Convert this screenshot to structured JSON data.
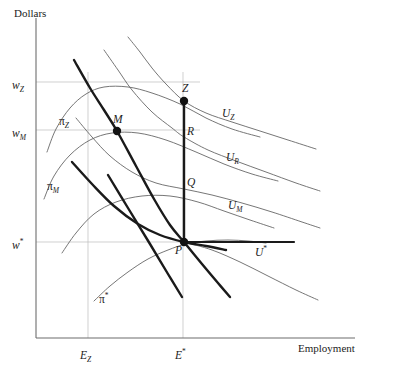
{
  "figure": {
    "y_axis_title": "Dollars",
    "x_axis_title": "Employment"
  },
  "axis_ticks": {
    "y": [
      {
        "id": "wz",
        "label_main": "w",
        "label_sub": "Z",
        "label_sup": "",
        "value_px": 82
      },
      {
        "id": "wm",
        "label_main": "w",
        "label_sub": "M",
        "label_sup": "",
        "value_px": 130
      },
      {
        "id": "wstar",
        "label_main": "w",
        "label_sub": "",
        "label_sup": "*",
        "value_px": 242
      }
    ],
    "x": [
      {
        "id": "ez",
        "label_main": "E",
        "label_sub": "Z",
        "label_sup": "",
        "value_px": 88
      },
      {
        "id": "estar",
        "label_main": "E",
        "label_sub": "",
        "label_sup": "*",
        "value_px": 183
      }
    ]
  },
  "points": [
    {
      "id": "M",
      "label": "M",
      "x": 117,
      "y": 131,
      "filled": true
    },
    {
      "id": "Z",
      "label": "Z",
      "x": 184,
      "y": 101,
      "filled": true
    },
    {
      "id": "R",
      "label": "R",
      "x": 184,
      "y": 137,
      "filled": false
    },
    {
      "id": "Q",
      "label": "Q",
      "x": 184,
      "y": 189,
      "filled": false
    },
    {
      "id": "P",
      "label": "P",
      "x": 184,
      "y": 242,
      "filled": true
    }
  ],
  "curve_labels": [
    {
      "id": "piZ",
      "base": "π",
      "sub": "Z",
      "sup": "",
      "x": 59,
      "y": 112
    },
    {
      "id": "piM",
      "base": "π",
      "sub": "M",
      "sup": "",
      "x": 47,
      "y": 177
    },
    {
      "id": "piStar",
      "base": "π",
      "sub": "",
      "sup": "*",
      "x": 99,
      "y": 290
    },
    {
      "id": "UZ",
      "base": "U",
      "sub": "Z",
      "sup": "",
      "x": 222,
      "y": 104
    },
    {
      "id": "UR",
      "base": "U",
      "sub": "R",
      "sup": "",
      "x": 226,
      "y": 148
    },
    {
      "id": "UM",
      "base": "U",
      "sub": "M",
      "sup": "",
      "x": 228,
      "y": 196
    },
    {
      "id": "UStar",
      "base": "U",
      "sub": "",
      "sup": "*",
      "x": 255,
      "y": 243
    }
  ],
  "chart_data": {
    "type": "line",
    "title": "",
    "xlabel": "Employment",
    "ylabel": "Dollars",
    "grid": true,
    "legend_position": "inline-curve-labels",
    "axis_origin_px": {
      "x": 36,
      "y": 338
    },
    "axis_end_px": {
      "x": 355,
      "y": 18
    },
    "marked_points": [
      {
        "name": "M",
        "x_px": 117,
        "y_px": 131,
        "wage_tick": "w_M",
        "employment_tick": ""
      },
      {
        "name": "Z",
        "x_px": 184,
        "y_px": 101,
        "wage_tick": "w_Z",
        "employment_tick": "E*"
      },
      {
        "name": "R",
        "x_px": 184,
        "y_px": 137,
        "wage_tick": "",
        "employment_tick": "E*"
      },
      {
        "name": "Q",
        "x_px": 184,
        "y_px": 189,
        "wage_tick": "",
        "employment_tick": "E*"
      },
      {
        "name": "P",
        "x_px": 184,
        "y_px": 242,
        "wage_tick": "w*",
        "employment_tick": "E*"
      }
    ],
    "series": [
      {
        "name": "π_Z",
        "kind": "isoprofit",
        "style": "thin-gray",
        "points": [
          [
            47,
            152
          ],
          [
            56,
            129
          ],
          [
            70,
            108
          ],
          [
            86,
            94
          ],
          [
            104,
            87
          ],
          [
            128,
            87
          ],
          [
            152,
            93
          ],
          [
            180,
            104
          ],
          [
            206,
            118
          ],
          [
            232,
            129
          ],
          [
            260,
            137
          ]
        ]
      },
      {
        "name": "π_M",
        "kind": "isoprofit",
        "style": "thin-gray",
        "points": [
          [
            44,
            199
          ],
          [
            54,
            176
          ],
          [
            70,
            155
          ],
          [
            90,
            140
          ],
          [
            112,
            133
          ],
          [
            138,
            133
          ],
          [
            166,
            140
          ],
          [
            196,
            152
          ],
          [
            224,
            164
          ],
          [
            252,
            174
          ],
          [
            278,
            181
          ]
        ]
      },
      {
        "name": "π_intermediate",
        "kind": "isoprofit",
        "style": "thin-gray",
        "points": [
          [
            62,
            253
          ],
          [
            76,
            233
          ],
          [
            94,
            214
          ],
          [
            116,
            202
          ],
          [
            142,
            196
          ],
          [
            170,
            196
          ],
          [
            198,
            202
          ],
          [
            224,
            211
          ],
          [
            250,
            220
          ],
          [
            274,
            228
          ]
        ]
      },
      {
        "name": "π_*",
        "kind": "isoprofit",
        "style": "thin-gray",
        "points": [
          [
            94,
            301
          ],
          [
            110,
            286
          ],
          [
            128,
            272
          ],
          [
            148,
            259
          ],
          [
            168,
            250
          ],
          [
            186,
            244
          ],
          [
            206,
            241
          ],
          [
            228,
            240
          ],
          [
            248,
            241
          ],
          [
            266,
            243
          ]
        ]
      },
      {
        "name": "U_Z",
        "kind": "indifference",
        "style": "thin-gray",
        "points": [
          [
            128,
            37
          ],
          [
            140,
            52
          ],
          [
            152,
            68
          ],
          [
            166,
            84
          ],
          [
            184,
            101
          ],
          [
            206,
            113
          ],
          [
            232,
            122
          ],
          [
            260,
            131
          ],
          [
            288,
            140
          ],
          [
            316,
            149
          ]
        ]
      },
      {
        "name": "U_R",
        "kind": "indifference",
        "style": "thin-gray",
        "points": [
          [
            104,
            50
          ],
          [
            118,
            70
          ],
          [
            132,
            90
          ],
          [
            152,
            112
          ],
          [
            172,
            128
          ],
          [
            184,
            137
          ],
          [
            208,
            150
          ],
          [
            236,
            161
          ],
          [
            266,
            172
          ],
          [
            296,
            183
          ],
          [
            320,
            191
          ]
        ]
      },
      {
        "name": "U_M",
        "kind": "indifference",
        "style": "thin-gray",
        "points": [
          [
            76,
            118
          ],
          [
            92,
            137
          ],
          [
            110,
            156
          ],
          [
            132,
            172
          ],
          [
            156,
            183
          ],
          [
            184,
            189
          ],
          [
            212,
            195
          ],
          [
            242,
            203
          ],
          [
            272,
            212
          ],
          [
            302,
            222
          ],
          [
            320,
            228
          ]
        ]
      },
      {
        "name": "U_*",
        "kind": "indifference",
        "style": "bold-horizontal",
        "points": [
          [
            184,
            242
          ],
          [
            216,
            242
          ],
          [
            248,
            242
          ],
          [
            280,
            242
          ],
          [
            294,
            242
          ]
        ]
      },
      {
        "name": "U_*_lower",
        "kind": "indifference",
        "style": "thin-gray",
        "points": [
          [
            184,
            242
          ],
          [
            212,
            250
          ],
          [
            240,
            262
          ],
          [
            268,
            276
          ],
          [
            296,
            290
          ],
          [
            318,
            300
          ]
        ]
      },
      {
        "name": "contract-curve",
        "kind": "contract",
        "style": "bold-dark",
        "points": [
          [
            74,
            60
          ],
          [
            90,
            88
          ],
          [
            104,
            110
          ],
          [
            117,
            131
          ],
          [
            136,
            166
          ],
          [
            154,
            199
          ],
          [
            170,
            225
          ],
          [
            184,
            242
          ],
          [
            202,
            264
          ],
          [
            218,
            283
          ],
          [
            230,
            297
          ]
        ]
      },
      {
        "name": "labor-demand",
        "kind": "demand",
        "style": "bold-dark",
        "points": [
          [
            72,
            162
          ],
          [
            92,
            184
          ],
          [
            114,
            206
          ],
          [
            138,
            224
          ],
          [
            160,
            235
          ],
          [
            184,
            242
          ],
          [
            206,
            246
          ],
          [
            226,
            250
          ]
        ]
      },
      {
        "name": "secondary-bold-line",
        "kind": "contract",
        "style": "bold-dark",
        "points": [
          [
            108,
            175
          ],
          [
            128,
            208
          ],
          [
            150,
            244
          ],
          [
            168,
            274
          ],
          [
            182,
            297
          ]
        ]
      },
      {
        "name": "vertical-E-star",
        "kind": "vertical",
        "style": "bold-dark",
        "points": [
          [
            184,
            101
          ],
          [
            184,
            242
          ]
        ]
      }
    ]
  }
}
